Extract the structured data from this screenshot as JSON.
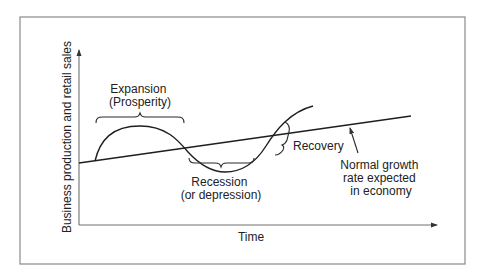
{
  "diagram": {
    "y_axis_label": "Business production and retail sales",
    "x_axis_label": "Time",
    "phases": [
      {
        "name": "expansion",
        "lines": [
          "Expansion",
          "(Prosperity)"
        ]
      },
      {
        "name": "recession",
        "lines": [
          "Recession",
          "(or depression)"
        ]
      },
      {
        "name": "recovery",
        "lines": [
          "Recovery"
        ]
      }
    ],
    "trend_annotation": {
      "lines": [
        "Normal growth",
        "rate expected",
        "in economy"
      ]
    },
    "colors": {
      "line": "#1e1e1e",
      "frame": "#8a8a8a",
      "axis": "#707070",
      "text": "#222222",
      "background": "#ffffff"
    }
  }
}
